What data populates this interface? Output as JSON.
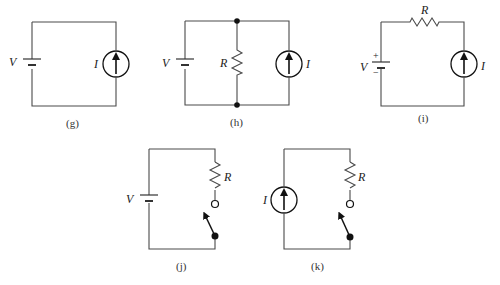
{
  "circuits": {
    "g": {
      "caption": "(g)",
      "voltage_label": "V",
      "current_label": "I"
    },
    "h": {
      "caption": "(h)",
      "voltage_label": "V",
      "resistor_label": "R",
      "current_label": "I"
    },
    "i": {
      "caption": "(i)",
      "voltage_label": "V",
      "resistor_label": "R",
      "current_label": "I",
      "plus_sign": "+",
      "minus_sign": "−"
    },
    "j": {
      "caption": "(j)",
      "voltage_label": "V",
      "resistor_label": "R"
    },
    "k": {
      "caption": "(k)",
      "current_label": "I",
      "resistor_label": "R"
    }
  },
  "colors": {
    "wire": "#4a4a4a",
    "text": "#222222"
  }
}
